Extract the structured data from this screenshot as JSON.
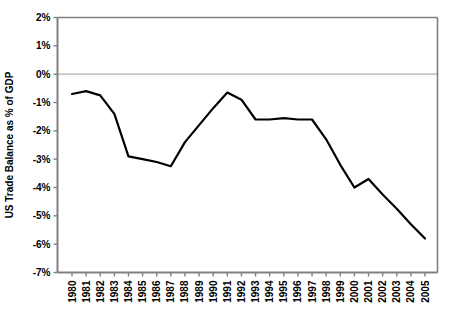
{
  "chart_data": {
    "type": "line",
    "title": "",
    "xlabel": "",
    "ylabel": "US Trade Balance as % of GDP",
    "ylim": [
      -7,
      2
    ],
    "ytick_labels": [
      "2%",
      "1%",
      "0%",
      "-1%",
      "-2%",
      "-3%",
      "-4%",
      "-5%",
      "-6%",
      "-7%"
    ],
    "ytick_values": [
      2,
      1,
      0,
      -1,
      -2,
      -3,
      -4,
      -5,
      -6,
      -7
    ],
    "grid": false,
    "zero_line": true,
    "legend": "none",
    "categories": [
      "1980",
      "1981",
      "1982",
      "1983",
      "1984",
      "1985",
      "1986",
      "1987",
      "1988",
      "1989",
      "1990",
      "1991",
      "1992",
      "1993",
      "1994",
      "1995",
      "1996",
      "1997",
      "1998",
      "1999",
      "2000",
      "2001",
      "2002",
      "2003",
      "2004",
      "2005"
    ],
    "values": [
      -0.7,
      -0.6,
      -0.75,
      -1.4,
      -2.9,
      -3.0,
      -3.1,
      -3.25,
      -2.4,
      -1.8,
      -1.2,
      -0.65,
      -0.9,
      -1.6,
      -1.6,
      -1.55,
      -1.6,
      -1.6,
      -2.3,
      -3.2,
      -4.0,
      -3.7,
      -4.25,
      -4.75,
      -5.3,
      -5.8
    ],
    "series_color": "#000000",
    "axis_color": "#808080",
    "zero_line_color": "#b0b0b0",
    "background_color": "#ffffff"
  }
}
